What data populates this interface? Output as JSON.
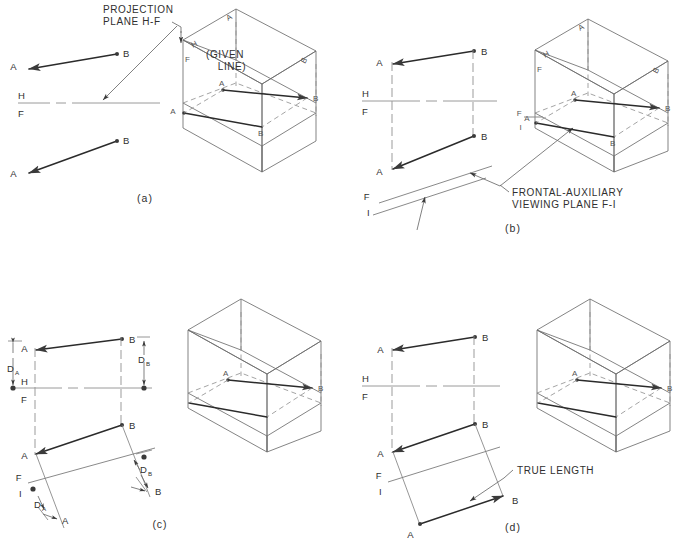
{
  "figure": {
    "background_color": "#ffffff",
    "line_color": "#2b2b2b",
    "construction_color": "#8a8a8a"
  },
  "panels": [
    {
      "id": "panel-a",
      "caption": "(a)",
      "annotations": [
        {
          "name": "projection-plane-note",
          "line1": "PROJECTION",
          "line2": "PLANE  H-F"
        },
        {
          "name": "given-line-note",
          "line1": "(GIVEN",
          "line2": "LINE)"
        }
      ],
      "reference_line": {
        "upper": "H",
        "lower": "F"
      },
      "points": {
        "top_view": {
          "a": "A",
          "b": "B"
        },
        "front_view": {
          "a": "A",
          "b": "B"
        }
      },
      "pictorial": {
        "fold_labels": {
          "h": "H",
          "f": "F"
        },
        "top_face": {
          "a": "A",
          "b": "B"
        },
        "mid_face": {
          "a": "A",
          "b": "B"
        },
        "front_face": {
          "a": "A",
          "b": "B"
        }
      }
    },
    {
      "id": "panel-b",
      "caption": "(b)",
      "annotations": [
        {
          "name": "frontal-auxiliary-note",
          "line1": "FRONTAL-AUXILIARY",
          "line2": "VIEWING PLANE F-I"
        }
      ],
      "reference_line": {
        "upper": "H",
        "lower": "F"
      },
      "auxiliary_fold": {
        "upper": "F",
        "lower": "I"
      },
      "points": {
        "top_view": {
          "a": "A",
          "b": "B"
        },
        "front_view": {
          "a": "A",
          "b": "B"
        }
      },
      "pictorial": {
        "fold_labels": {
          "h": "H",
          "f": "F"
        },
        "aux_fold_labels": {
          "f": "F",
          "i": "I"
        },
        "top_face": {
          "a": "A",
          "b": "B"
        },
        "mid_face": {
          "a": "A",
          "b": "B"
        },
        "front_face": {
          "a": "A",
          "b": "B"
        }
      }
    },
    {
      "id": "panel-c",
      "caption": "(c)",
      "reference_line": {
        "upper": "H",
        "lower": "F"
      },
      "auxiliary_fold": {
        "upper": "F",
        "lower": "I"
      },
      "points": {
        "top_view": {
          "a": "A",
          "b": "B"
        },
        "front_view": {
          "a": "A",
          "b": "B"
        },
        "aux_view": {
          "a": "A",
          "b": "B"
        }
      },
      "dimensions": [
        {
          "name": "depth-a-top",
          "label": "D",
          "subscript": "A"
        },
        {
          "name": "depth-b-top",
          "label": "D",
          "subscript": "B"
        },
        {
          "name": "depth-a-aux",
          "label": "D",
          "subscript": "A"
        },
        {
          "name": "depth-b-aux",
          "label": "D",
          "subscript": "B"
        }
      ],
      "pictorial": {
        "mid_face": {
          "a": "A",
          "b": "B"
        }
      }
    },
    {
      "id": "panel-d",
      "caption": "(d)",
      "annotations": [
        {
          "name": "true-length-note",
          "text": "TRUE LENGTH"
        }
      ],
      "reference_line": {
        "upper": "H",
        "lower": "F"
      },
      "auxiliary_fold": {
        "upper": "F",
        "lower": "I"
      },
      "points": {
        "top_view": {
          "a": "A",
          "b": "B"
        },
        "front_view": {
          "a": "A",
          "b": "B"
        },
        "aux_view": {
          "a": "A",
          "b": "B"
        }
      },
      "pictorial": {
        "mid_face": {
          "a": "A",
          "b": "B"
        }
      }
    }
  ]
}
